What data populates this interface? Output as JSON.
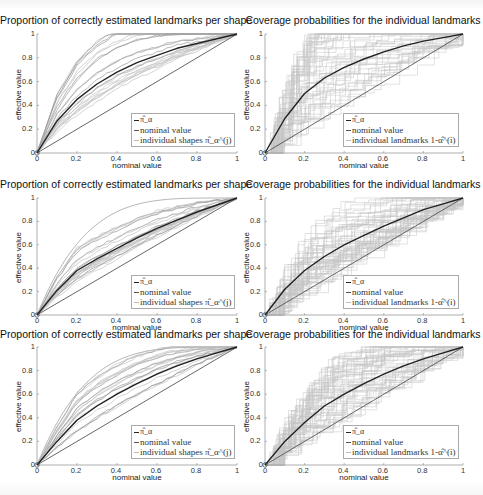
{
  "figure": {
    "panels": [
      {
        "id": "r1c1",
        "title": "Proportion of correctly estimated landmarks per shape",
        "xlabel": "nominal value",
        "ylabel": "effective value",
        "legend": [
          "π̂_α",
          "nominal value",
          "individual shapes π̂_α^(j)"
        ]
      },
      {
        "id": "r1c2",
        "title": "Coverage probabilities for the individual landmarks",
        "xlabel": "nominal value",
        "ylabel": "effective value",
        "legend": [
          "π̂_α",
          "nominal value",
          "individual landmarks 1-α̂^(i)"
        ]
      },
      {
        "id": "r2c1",
        "title": "Proportion of correctly estimated landmarks per shape",
        "xlabel": "nominal value",
        "ylabel": "effective value",
        "legend": [
          "π̂_α",
          "nominal value",
          "individual shapes π̂_α^(j)"
        ]
      },
      {
        "id": "r2c2",
        "title": "Coverage probabilities for the individual landmarks",
        "xlabel": "nominal value",
        "ylabel": "effective value",
        "legend": [
          "π̂_α",
          "nominal value",
          "individual landmarks 1-α̂^(i)"
        ]
      },
      {
        "id": "r3c1",
        "title": "Proportion of correctly estimated landmarks per shape",
        "xlabel": "nominal value",
        "ylabel": "effective value",
        "legend": [
          "π̂_α",
          "nominal value",
          "individual shapes π̂_α^(j)"
        ]
      },
      {
        "id": "r3c2",
        "title": "Coverage probabilities for the individual landmarks",
        "xlabel": "nominal value",
        "ylabel": "effective value",
        "legend": [
          "π̂_α",
          "nominal value",
          "individual landmarks 1-α̂^(i)"
        ]
      }
    ],
    "xticks": [
      "0",
      "0.2",
      "0.4",
      "0.6",
      "0.8",
      "1"
    ],
    "yticks": [
      "0",
      "0.2",
      "0.4",
      "0.6",
      "0.8",
      "1"
    ]
  },
  "chart_data": [
    {
      "type": "line",
      "title": "Proportion of correctly estimated landmarks per shape",
      "xlabel": "nominal value",
      "ylabel": "effective value",
      "xlim": [
        0,
        1
      ],
      "ylim": [
        0,
        1
      ],
      "grid": false,
      "legend_position": "lower right",
      "x": [
        0,
        0.1,
        0.2,
        0.3,
        0.4,
        0.5,
        0.6,
        0.7,
        0.8,
        0.9,
        1
      ],
      "series": [
        {
          "name": "π̂_α",
          "values": [
            0,
            0.27,
            0.45,
            0.58,
            0.68,
            0.76,
            0.82,
            0.88,
            0.92,
            0.96,
            1
          ]
        },
        {
          "name": "nominal value",
          "values": [
            0,
            0.1,
            0.2,
            0.3,
            0.4,
            0.5,
            0.6,
            0.7,
            0.8,
            0.9,
            1
          ]
        },
        {
          "name": "individual shapes π̂_α^(j)",
          "values": "many light-gray curves spread between nominal line and ~0.98 envelope"
        }
      ]
    },
    {
      "type": "line",
      "title": "Coverage probabilities for the individual landmarks",
      "xlabel": "nominal value",
      "ylabel": "effective value",
      "xlim": [
        0,
        1
      ],
      "ylim": [
        0,
        1
      ],
      "grid": false,
      "legend_position": "lower right",
      "x": [
        0,
        0.1,
        0.2,
        0.3,
        0.4,
        0.5,
        0.6,
        0.7,
        0.8,
        0.9,
        1
      ],
      "series": [
        {
          "name": "π̂_α",
          "values": [
            0,
            0.29,
            0.5,
            0.63,
            0.72,
            0.79,
            0.85,
            0.9,
            0.94,
            0.97,
            1
          ]
        },
        {
          "name": "nominal value",
          "values": [
            0,
            0.1,
            0.2,
            0.3,
            0.4,
            0.5,
            0.6,
            0.7,
            0.8,
            0.9,
            1
          ]
        },
        {
          "name": "individual landmarks 1-α̂^(i)",
          "values": "many light-gray step curves filling region from 0 to 1"
        }
      ]
    },
    {
      "type": "line",
      "title": "Proportion of correctly estimated landmarks per shape",
      "xlabel": "nominal value",
      "ylabel": "effective value",
      "xlim": [
        0,
        1
      ],
      "ylim": [
        0,
        1
      ],
      "grid": false,
      "legend_position": "lower right",
      "x": [
        0,
        0.1,
        0.2,
        0.3,
        0.4,
        0.5,
        0.6,
        0.7,
        0.8,
        0.9,
        1
      ],
      "series": [
        {
          "name": "π̂_α",
          "values": [
            0,
            0.21,
            0.38,
            0.48,
            0.57,
            0.66,
            0.74,
            0.81,
            0.88,
            0.94,
            1
          ]
        },
        {
          "name": "nominal value",
          "values": [
            0,
            0.1,
            0.2,
            0.3,
            0.4,
            0.5,
            0.6,
            0.7,
            0.8,
            0.9,
            1
          ]
        },
        {
          "name": "individual shapes π̂_α^(j)",
          "values": "many light-gray curves"
        }
      ]
    },
    {
      "type": "line",
      "title": "Coverage probabilities for the individual landmarks",
      "xlabel": "nominal value",
      "ylabel": "effective value",
      "xlim": [
        0,
        1
      ],
      "ylim": [
        0,
        1
      ],
      "grid": false,
      "legend_position": "lower right",
      "x": [
        0,
        0.1,
        0.2,
        0.3,
        0.4,
        0.5,
        0.6,
        0.7,
        0.8,
        0.9,
        1
      ],
      "series": [
        {
          "name": "π̂_α",
          "values": [
            0,
            0.22,
            0.38,
            0.5,
            0.6,
            0.68,
            0.76,
            0.83,
            0.9,
            0.95,
            1
          ]
        },
        {
          "name": "nominal value",
          "values": [
            0,
            0.1,
            0.2,
            0.3,
            0.4,
            0.5,
            0.6,
            0.7,
            0.8,
            0.9,
            1
          ]
        },
        {
          "name": "individual landmarks 1-α̂^(i)",
          "values": "many light-gray step curves"
        }
      ]
    },
    {
      "type": "line",
      "title": "Proportion of correctly estimated landmarks per shape",
      "xlabel": "nominal value",
      "ylabel": "effective value",
      "xlim": [
        0,
        1
      ],
      "ylim": [
        0,
        1
      ],
      "grid": false,
      "legend_position": "lower right",
      "x": [
        0,
        0.1,
        0.2,
        0.3,
        0.4,
        0.5,
        0.6,
        0.7,
        0.8,
        0.9,
        1
      ],
      "series": [
        {
          "name": "π̂_α",
          "values": [
            0,
            0.2,
            0.38,
            0.5,
            0.6,
            0.69,
            0.77,
            0.84,
            0.9,
            0.95,
            1
          ]
        },
        {
          "name": "nominal value",
          "values": [
            0,
            0.1,
            0.2,
            0.3,
            0.4,
            0.5,
            0.6,
            0.7,
            0.8,
            0.9,
            1
          ]
        },
        {
          "name": "individual shapes π̂_α^(j)",
          "values": "many light-gray curves"
        }
      ]
    },
    {
      "type": "line",
      "title": "Coverage probabilities for the individual landmarks",
      "xlabel": "nominal value",
      "ylabel": "effective value",
      "xlim": [
        0,
        1
      ],
      "ylim": [
        0,
        1
      ],
      "grid": false,
      "legend_position": "lower right",
      "x": [
        0,
        0.1,
        0.2,
        0.3,
        0.4,
        0.5,
        0.6,
        0.7,
        0.8,
        0.9,
        1
      ],
      "series": [
        {
          "name": "π̂_α",
          "values": [
            0,
            0.2,
            0.36,
            0.5,
            0.6,
            0.69,
            0.77,
            0.84,
            0.9,
            0.95,
            1
          ]
        },
        {
          "name": "nominal value",
          "values": [
            0,
            0.1,
            0.2,
            0.3,
            0.4,
            0.5,
            0.6,
            0.7,
            0.8,
            0.9,
            1
          ]
        },
        {
          "name": "individual landmarks 1-α̂^(i)",
          "values": "many light-gray step curves"
        }
      ]
    }
  ]
}
